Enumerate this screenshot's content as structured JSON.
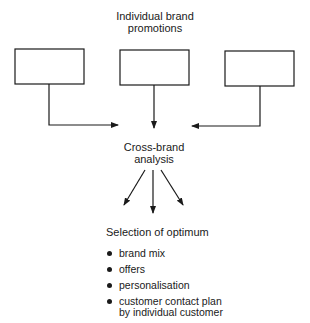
{
  "diagram": {
    "top_label_line1": "Individual brand",
    "top_label_line2": "promotions",
    "boxes": [
      "",
      "",
      ""
    ],
    "middle_label_line1": "Cross-brand",
    "middle_label_line2": "analysis",
    "bottom_heading": "Selection of optimum",
    "bottom_items": [
      "brand mix",
      "offers",
      "personalisation",
      "customer contact plan by individual customer"
    ],
    "bottom_item_4_line1": "customer contact plan",
    "bottom_item_4_line2": "by individual customer",
    "line_color": "#1a1a1a"
  }
}
